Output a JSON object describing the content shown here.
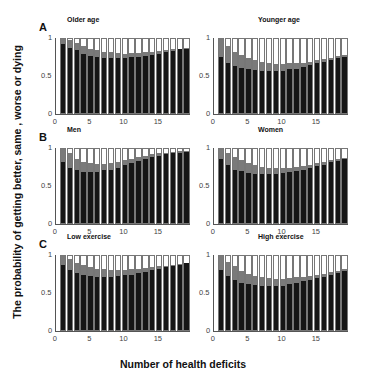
{
  "figure": {
    "ylabel": "The probability of getting better, same , worse or dying",
    "xlabel": "Number of health deficits"
  },
  "chart_data": [
    {
      "type": "bar",
      "stacked": true,
      "letter": "A",
      "title": "Older age",
      "x": [
        1,
        2,
        3,
        4,
        5,
        6,
        7,
        8,
        9,
        10,
        11,
        12,
        13,
        14,
        15,
        16,
        17,
        18,
        19
      ],
      "series": [
        {
          "name": "dark",
          "values": [
            0.93,
            0.88,
            0.85,
            0.8,
            0.77,
            0.76,
            0.75,
            0.75,
            0.75,
            0.75,
            0.76,
            0.76,
            0.77,
            0.79,
            0.8,
            0.82,
            0.84,
            0.86,
            0.87
          ]
        },
        {
          "name": "dark+grey",
          "values": [
            1.0,
            0.98,
            0.94,
            0.91,
            0.87,
            0.85,
            0.83,
            0.82,
            0.81,
            0.8,
            0.81,
            0.81,
            0.82,
            0.83,
            0.84,
            0.85,
            0.86,
            0.87,
            0.88
          ]
        }
      ],
      "yticks": [
        "0",
        "0.5",
        "1"
      ],
      "xticks": [
        "0",
        "5",
        "10",
        "15"
      ],
      "ylim": [
        0,
        1
      ],
      "xlim": [
        0,
        19.5
      ]
    },
    {
      "type": "bar",
      "stacked": true,
      "letter": "",
      "title": "Younger age",
      "x": [
        1,
        2,
        3,
        4,
        5,
        6,
        7,
        8,
        9,
        10,
        11,
        12,
        13,
        14,
        15,
        16,
        17,
        18,
        19
      ],
      "series": [
        {
          "name": "dark",
          "values": [
            0.76,
            0.68,
            0.63,
            0.61,
            0.59,
            0.58,
            0.57,
            0.57,
            0.57,
            0.57,
            0.59,
            0.6,
            0.62,
            0.65,
            0.67,
            0.69,
            0.72,
            0.74,
            0.76
          ]
        },
        {
          "name": "dark+grey",
          "values": [
            1.0,
            0.91,
            0.83,
            0.78,
            0.74,
            0.71,
            0.69,
            0.67,
            0.66,
            0.66,
            0.67,
            0.67,
            0.68,
            0.69,
            0.71,
            0.73,
            0.75,
            0.77,
            0.79
          ]
        }
      ],
      "yticks": [
        "0",
        "0.5",
        "1"
      ],
      "xticks": [
        "0",
        "5",
        "10",
        "15"
      ],
      "ylim": [
        0,
        1
      ],
      "xlim": [
        0,
        19.5
      ]
    },
    {
      "type": "bar",
      "stacked": true,
      "letter": "B",
      "title": "Men",
      "x": [
        1,
        2,
        3,
        4,
        5,
        6,
        7,
        8,
        9,
        10,
        11,
        12,
        13,
        14,
        15,
        16,
        17,
        18,
        19
      ],
      "series": [
        {
          "name": "dark",
          "values": [
            0.82,
            0.75,
            0.71,
            0.69,
            0.69,
            0.69,
            0.71,
            0.72,
            0.75,
            0.78,
            0.81,
            0.84,
            0.87,
            0.89,
            0.91,
            0.93,
            0.94,
            0.95,
            0.96
          ]
        },
        {
          "name": "dark+grey",
          "values": [
            1.0,
            0.95,
            0.87,
            0.83,
            0.81,
            0.8,
            0.8,
            0.81,
            0.83,
            0.85,
            0.87,
            0.89,
            0.91,
            0.93,
            0.94,
            0.95,
            0.96,
            0.97,
            0.97
          ]
        }
      ],
      "yticks": [
        "0",
        "0.5",
        "1"
      ],
      "xticks": [
        "0",
        "5",
        "10",
        "15"
      ],
      "ylim": [
        0,
        1
      ],
      "xlim": [
        0,
        19.5
      ]
    },
    {
      "type": "bar",
      "stacked": true,
      "letter": "",
      "title": "Women",
      "x": [
        1,
        2,
        3,
        4,
        5,
        6,
        7,
        8,
        9,
        10,
        11,
        12,
        13,
        14,
        15,
        16,
        17,
        18,
        19
      ],
      "series": [
        {
          "name": "dark",
          "values": [
            0.87,
            0.79,
            0.72,
            0.7,
            0.68,
            0.66,
            0.66,
            0.66,
            0.66,
            0.67,
            0.69,
            0.7,
            0.72,
            0.74,
            0.77,
            0.79,
            0.82,
            0.84,
            0.87
          ]
        },
        {
          "name": "dark+grey",
          "values": [
            1.0,
            0.94,
            0.89,
            0.85,
            0.81,
            0.78,
            0.76,
            0.75,
            0.74,
            0.74,
            0.75,
            0.76,
            0.77,
            0.79,
            0.81,
            0.83,
            0.85,
            0.86,
            0.88
          ]
        }
      ],
      "yticks": [
        "0",
        "0.5",
        "1"
      ],
      "xticks": [
        "0",
        "5",
        "10",
        "15"
      ],
      "ylim": [
        0,
        1
      ],
      "xlim": [
        0,
        19.5
      ]
    },
    {
      "type": "bar",
      "stacked": true,
      "letter": "C",
      "title": "Low exercise",
      "x": [
        1,
        2,
        3,
        4,
        5,
        6,
        7,
        8,
        9,
        10,
        11,
        12,
        13,
        14,
        15,
        16,
        17,
        18,
        19
      ],
      "series": [
        {
          "name": "dark",
          "values": [
            0.88,
            0.81,
            0.77,
            0.75,
            0.73,
            0.72,
            0.72,
            0.72,
            0.73,
            0.74,
            0.75,
            0.77,
            0.79,
            0.81,
            0.83,
            0.85,
            0.87,
            0.88,
            0.9
          ]
        },
        {
          "name": "dark+grey",
          "values": [
            1.0,
            0.96,
            0.91,
            0.88,
            0.85,
            0.83,
            0.82,
            0.81,
            0.81,
            0.81,
            0.82,
            0.83,
            0.84,
            0.85,
            0.86,
            0.87,
            0.88,
            0.89,
            0.91
          ]
        }
      ],
      "yticks": [
        "0",
        "0.5",
        "1"
      ],
      "xticks": [
        "0",
        "5",
        "10",
        "15"
      ],
      "ylim": [
        0,
        1
      ],
      "xlim": [
        0,
        19.5
      ]
    },
    {
      "type": "bar",
      "stacked": true,
      "letter": "",
      "title": "High exercise",
      "x": [
        1,
        2,
        3,
        4,
        5,
        6,
        7,
        8,
        9,
        10,
        11,
        12,
        13,
        14,
        15,
        16,
        17,
        18,
        19
      ],
      "series": [
        {
          "name": "dark",
          "values": [
            0.81,
            0.73,
            0.68,
            0.64,
            0.62,
            0.61,
            0.6,
            0.6,
            0.6,
            0.6,
            0.62,
            0.64,
            0.66,
            0.68,
            0.7,
            0.72,
            0.75,
            0.77,
            0.8
          ]
        },
        {
          "name": "dark+grey",
          "values": [
            1.0,
            0.92,
            0.86,
            0.8,
            0.76,
            0.73,
            0.71,
            0.7,
            0.69,
            0.69,
            0.7,
            0.71,
            0.72,
            0.73,
            0.75,
            0.76,
            0.78,
            0.8,
            0.82
          ]
        }
      ],
      "yticks": [
        "0",
        "0.5",
        "1"
      ],
      "xticks": [
        "0",
        "5",
        "10",
        "15"
      ],
      "ylim": [
        0,
        1
      ],
      "xlim": [
        0,
        19.5
      ]
    }
  ]
}
